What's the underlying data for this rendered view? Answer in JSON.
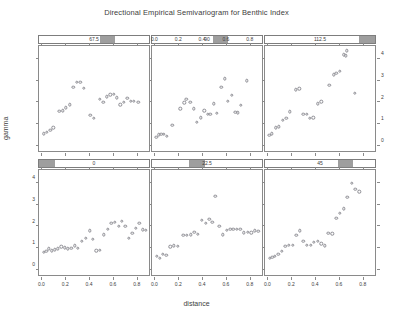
{
  "chart_data": {
    "type": "scatter",
    "title": "Directional Empirical Semivariogram for Benthic Index",
    "xlabel": "distance",
    "ylabel": "gamma",
    "xlim": [
      -0.02,
      0.92
    ],
    "ylim": [
      -0.35,
      4.6
    ],
    "grid": false,
    "legend": null,
    "layout": "trellis 2 rows x 3 columns",
    "xticks": [
      0.0,
      0.2,
      0.4,
      0.6,
      0.8
    ],
    "xtick_labels": [
      "0.0",
      "0.2",
      "0.4",
      "0.6",
      "0.8"
    ],
    "yticks": [
      0,
      1,
      2,
      3,
      4
    ],
    "ytick_labels": [
      "0",
      "1",
      "2",
      "3",
      "4"
    ],
    "panels": [
      {
        "strip_label": "0",
        "row": 1,
        "col": 0,
        "strip_fill_start": 0.0,
        "strip_fill_end": 0.145,
        "x_axis": "bottom",
        "y_axis": "left",
        "points": [
          {
            "x": 0.018,
            "y": 0.7
          },
          {
            "x": 0.04,
            "y": 0.76
          },
          {
            "x": 0.062,
            "y": 0.86
          },
          {
            "x": 0.085,
            "y": 0.78
          },
          {
            "x": 0.112,
            "y": 0.82
          },
          {
            "x": 0.14,
            "y": 0.86
          },
          {
            "x": 0.168,
            "y": 0.96
          },
          {
            "x": 0.196,
            "y": 0.92
          },
          {
            "x": 0.222,
            "y": 0.86
          },
          {
            "x": 0.25,
            "y": 0.88
          },
          {
            "x": 0.278,
            "y": 1.0
          },
          {
            "x": 0.308,
            "y": 0.9
          },
          {
            "x": 0.34,
            "y": 1.22
          },
          {
            "x": 0.372,
            "y": 1.34
          },
          {
            "x": 0.404,
            "y": 1.7
          },
          {
            "x": 0.432,
            "y": 1.3
          },
          {
            "x": 0.462,
            "y": 0.78
          },
          {
            "x": 0.492,
            "y": 0.8
          },
          {
            "x": 0.524,
            "y": 1.52
          },
          {
            "x": 0.556,
            "y": 1.78
          },
          {
            "x": 0.588,
            "y": 2.06
          },
          {
            "x": 0.618,
            "y": 2.1
          },
          {
            "x": 0.648,
            "y": 1.9
          },
          {
            "x": 0.676,
            "y": 2.14
          },
          {
            "x": 0.704,
            "y": 1.92
          },
          {
            "x": 0.732,
            "y": 1.34
          },
          {
            "x": 0.762,
            "y": 1.58
          },
          {
            "x": 0.792,
            "y": 1.82
          },
          {
            "x": 0.822,
            "y": 2.06
          },
          {
            "x": 0.852,
            "y": 1.74
          },
          {
            "x": 0.878,
            "y": 1.72
          }
        ]
      },
      {
        "strip_label": "22.5",
        "row": 1,
        "col": 1,
        "strip_fill_start": 0.335,
        "strip_fill_end": 0.48,
        "x_axis": "bottom",
        "y_axis": "none",
        "points": [
          {
            "x": 0.02,
            "y": 0.52
          },
          {
            "x": 0.044,
            "y": 0.42
          },
          {
            "x": 0.07,
            "y": 0.6
          },
          {
            "x": 0.1,
            "y": 0.58
          },
          {
            "x": 0.132,
            "y": 0.96
          },
          {
            "x": 0.162,
            "y": 1.0
          },
          {
            "x": 0.196,
            "y": 0.98
          },
          {
            "x": 0.244,
            "y": 1.48
          },
          {
            "x": 0.274,
            "y": 1.5
          },
          {
            "x": 0.304,
            "y": 1.52
          },
          {
            "x": 0.334,
            "y": 1.64
          },
          {
            "x": 0.366,
            "y": 1.54
          },
          {
            "x": 0.4,
            "y": 2.18
          },
          {
            "x": 0.432,
            "y": 2.04
          },
          {
            "x": 0.462,
            "y": 2.22
          },
          {
            "x": 0.486,
            "y": 2.08
          },
          {
            "x": 0.512,
            "y": 3.3
          },
          {
            "x": 0.546,
            "y": 1.9
          },
          {
            "x": 0.576,
            "y": 1.52
          },
          {
            "x": 0.608,
            "y": 1.72
          },
          {
            "x": 0.636,
            "y": 1.76
          },
          {
            "x": 0.664,
            "y": 1.76
          },
          {
            "x": 0.692,
            "y": 1.78
          },
          {
            "x": 0.72,
            "y": 1.76
          },
          {
            "x": 0.752,
            "y": 1.6
          },
          {
            "x": 0.782,
            "y": 1.62
          },
          {
            "x": 0.812,
            "y": 1.6
          },
          {
            "x": 0.842,
            "y": 1.7
          },
          {
            "x": 0.872,
            "y": 1.68
          }
        ]
      },
      {
        "strip_label": "45",
        "row": 1,
        "col": 2,
        "strip_fill_start": 0.66,
        "strip_fill_end": 0.8,
        "x_axis": "bottom",
        "y_axis": "none",
        "points": [
          {
            "x": 0.018,
            "y": 0.44
          },
          {
            "x": 0.04,
            "y": 0.48
          },
          {
            "x": 0.064,
            "y": 0.52
          },
          {
            "x": 0.092,
            "y": 0.62
          },
          {
            "x": 0.12,
            "y": 0.76
          },
          {
            "x": 0.15,
            "y": 0.98
          },
          {
            "x": 0.18,
            "y": 1.04
          },
          {
            "x": 0.212,
            "y": 1.02
          },
          {
            "x": 0.242,
            "y": 1.48
          },
          {
            "x": 0.272,
            "y": 1.7
          },
          {
            "x": 0.302,
            "y": 1.22
          },
          {
            "x": 0.332,
            "y": 1.02
          },
          {
            "x": 0.362,
            "y": 1.02
          },
          {
            "x": 0.392,
            "y": 1.18
          },
          {
            "x": 0.422,
            "y": 1.22
          },
          {
            "x": 0.452,
            "y": 1.1
          },
          {
            "x": 0.48,
            "y": 1.0
          },
          {
            "x": 0.512,
            "y": 1.58
          },
          {
            "x": 0.546,
            "y": 1.56
          },
          {
            "x": 0.58,
            "y": 2.28
          },
          {
            "x": 0.61,
            "y": 2.52
          },
          {
            "x": 0.64,
            "y": 2.72
          },
          {
            "x": 0.672,
            "y": 3.26
          },
          {
            "x": 0.706,
            "y": 3.9
          },
          {
            "x": 0.738,
            "y": 3.62
          },
          {
            "x": 0.77,
            "y": 3.5
          }
        ]
      },
      {
        "strip_label": "67.5",
        "row": 0,
        "col": 0,
        "strip_fill_start": 0.555,
        "strip_fill_end": 0.695,
        "x_axis": "none",
        "y_axis": "none",
        "points": [
          {
            "x": 0.022,
            "y": 0.46
          },
          {
            "x": 0.048,
            "y": 0.52
          },
          {
            "x": 0.074,
            "y": 0.6
          },
          {
            "x": 0.1,
            "y": 0.72
          },
          {
            "x": 0.15,
            "y": 1.48
          },
          {
            "x": 0.178,
            "y": 1.52
          },
          {
            "x": 0.206,
            "y": 1.66
          },
          {
            "x": 0.236,
            "y": 1.8
          },
          {
            "x": 0.268,
            "y": 2.6
          },
          {
            "x": 0.296,
            "y": 2.82
          },
          {
            "x": 0.326,
            "y": 2.84
          },
          {
            "x": 0.358,
            "y": 2.56
          },
          {
            "x": 0.412,
            "y": 1.32
          },
          {
            "x": 0.44,
            "y": 1.18
          },
          {
            "x": 0.492,
            "y": 2.06
          },
          {
            "x": 0.52,
            "y": 1.9
          },
          {
            "x": 0.55,
            "y": 2.16
          },
          {
            "x": 0.578,
            "y": 2.26
          },
          {
            "x": 0.606,
            "y": 2.28
          },
          {
            "x": 0.634,
            "y": 2.12
          },
          {
            "x": 0.662,
            "y": 1.8
          },
          {
            "x": 0.69,
            "y": 1.92
          },
          {
            "x": 0.72,
            "y": 2.08
          },
          {
            "x": 0.748,
            "y": 1.96
          },
          {
            "x": 0.778,
            "y": 1.96
          },
          {
            "x": 0.812,
            "y": 1.9
          }
        ]
      },
      {
        "strip_label": "90",
        "row": 0,
        "col": 1,
        "strip_fill_start": 0.555,
        "strip_fill_end": 0.695,
        "x_axis": "top",
        "y_axis": "none",
        "points": [
          {
            "x": 0.016,
            "y": 0.3
          },
          {
            "x": 0.038,
            "y": 0.4
          },
          {
            "x": 0.058,
            "y": 0.42
          },
          {
            "x": 0.08,
            "y": 0.42
          },
          {
            "x": 0.102,
            "y": 0.34
          },
          {
            "x": 0.152,
            "y": 0.84
          },
          {
            "x": 0.216,
            "y": 1.6
          },
          {
            "x": 0.252,
            "y": 1.88
          },
          {
            "x": 0.268,
            "y": 2.04
          },
          {
            "x": 0.302,
            "y": 1.92
          },
          {
            "x": 0.33,
            "y": 1.6
          },
          {
            "x": 0.356,
            "y": 0.98
          },
          {
            "x": 0.388,
            "y": 1.2
          },
          {
            "x": 0.418,
            "y": 1.52
          },
          {
            "x": 0.446,
            "y": 1.34
          },
          {
            "x": 0.47,
            "y": 1.34
          },
          {
            "x": 0.498,
            "y": 1.84
          },
          {
            "x": 0.524,
            "y": 1.4
          },
          {
            "x": 0.562,
            "y": 2.6
          },
          {
            "x": 0.59,
            "y": 3.0
          },
          {
            "x": 0.618,
            "y": 1.96
          },
          {
            "x": 0.648,
            "y": 2.22
          },
          {
            "x": 0.68,
            "y": 1.44
          },
          {
            "x": 0.702,
            "y": 1.42
          },
          {
            "x": 0.724,
            "y": 1.78
          },
          {
            "x": 0.778,
            "y": 2.9
          }
        ]
      },
      {
        "strip_label": "112.5",
        "row": 0,
        "col": 2,
        "strip_fill_start": 0.855,
        "strip_fill_end": 1.0,
        "x_axis": "none",
        "y_axis": "right",
        "points": [
          {
            "x": 0.016,
            "y": 0.38
          },
          {
            "x": 0.036,
            "y": 0.46
          },
          {
            "x": 0.072,
            "y": 0.72
          },
          {
            "x": 0.096,
            "y": 0.78
          },
          {
            "x": 0.13,
            "y": 1.08
          },
          {
            "x": 0.158,
            "y": 1.18
          },
          {
            "x": 0.186,
            "y": 1.46
          },
          {
            "x": 0.24,
            "y": 2.48
          },
          {
            "x": 0.268,
            "y": 2.54
          },
          {
            "x": 0.3,
            "y": 1.34
          },
          {
            "x": 0.33,
            "y": 1.36
          },
          {
            "x": 0.356,
            "y": 1.16
          },
          {
            "x": 0.384,
            "y": 1.2
          },
          {
            "x": 0.424,
            "y": 1.84
          },
          {
            "x": 0.452,
            "y": 1.94
          },
          {
            "x": 0.52,
            "y": 2.7
          },
          {
            "x": 0.556,
            "y": 3.18
          },
          {
            "x": 0.578,
            "y": 3.24
          },
          {
            "x": 0.606,
            "y": 3.34
          },
          {
            "x": 0.64,
            "y": 4.1
          },
          {
            "x": 0.66,
            "y": 4.06
          },
          {
            "x": 0.668,
            "y": 4.3
          },
          {
            "x": 0.736,
            "y": 2.32
          }
        ]
      }
    ]
  }
}
